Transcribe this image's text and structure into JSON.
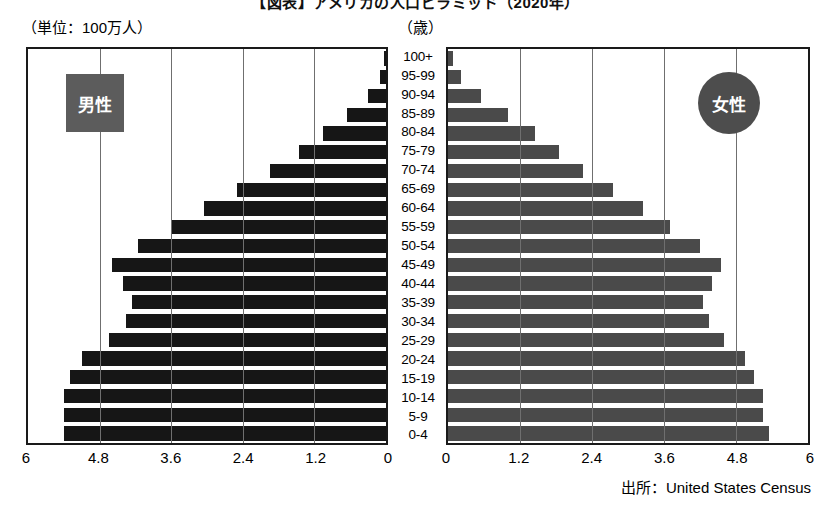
{
  "title": "【図表】アメリカの人口ピラミッド（2020年）",
  "unit_label": "（単位：100万人）",
  "age_unit_label": "（歳）",
  "legend": {
    "male": "男性",
    "female": "女性"
  },
  "source": "出所：United States Census",
  "colors": {
    "male_bar": "#161616",
    "female_bar": "#4a4a4a",
    "legend_male_bg": "#5c5c5c",
    "legend_female_bg": "#4d4d4d",
    "gridline": "#6f6f6f",
    "border": "#1a1a1a"
  },
  "chart_data": {
    "type": "bar",
    "subtype": "population-pyramid",
    "title": "【図表】アメリカの人口ピラミッド（2020年）",
    "xlabel": "（単位：100万人）",
    "ylabel": "（歳）",
    "source": "出所：United States Census",
    "grid": true,
    "legend_position": "inside-top",
    "categories": [
      "100+",
      "95-99",
      "90-94",
      "85-89",
      "80-84",
      "75-79",
      "70-74",
      "65-69",
      "60-64",
      "55-59",
      "50-54",
      "45-49",
      "40-44",
      "35-39",
      "30-34",
      "25-29",
      "20-24",
      "15-19",
      "10-14",
      "5-9",
      "0-4"
    ],
    "left_axis": {
      "label": "男性",
      "ticks": [
        "6",
        "4.8",
        "3.6",
        "2.4",
        "1.2",
        "0"
      ],
      "tick_values": [
        6,
        4.8,
        3.6,
        2.4,
        1.2,
        0
      ],
      "range": [
        6,
        0
      ],
      "direction": "reversed"
    },
    "right_axis": {
      "label": "女性",
      "ticks": [
        "0",
        "1.2",
        "2.4",
        "3.6",
        "4.8",
        "6"
      ],
      "tick_values": [
        0,
        1.2,
        2.4,
        3.6,
        4.8,
        6
      ],
      "range": [
        0,
        6
      ],
      "direction": "normal"
    },
    "series": [
      {
        "name": "男性",
        "side": "left",
        "values": [
          0.03,
          0.1,
          0.3,
          0.65,
          1.05,
          1.45,
          1.95,
          2.5,
          3.05,
          3.6,
          4.15,
          4.6,
          4.4,
          4.25,
          4.35,
          4.65,
          5.1,
          5.3,
          5.4,
          5.4,
          5.4
        ]
      },
      {
        "name": "女性",
        "side": "right",
        "values": [
          0.08,
          0.22,
          0.55,
          1.0,
          1.45,
          1.85,
          2.25,
          2.75,
          3.25,
          3.7,
          4.2,
          4.55,
          4.4,
          4.25,
          4.35,
          4.6,
          4.95,
          5.1,
          5.25,
          5.25,
          5.35
        ]
      }
    ]
  }
}
